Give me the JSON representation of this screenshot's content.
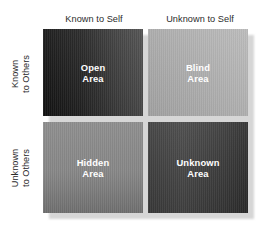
{
  "diagram": {
    "columns": [
      {
        "id": "known-to-self",
        "label": "Known to Self"
      },
      {
        "id": "unknown-to-self",
        "label": "Unknown to Self"
      }
    ],
    "rows": [
      {
        "id": "known-to-others",
        "line1": "Known",
        "line2": "to Others"
      },
      {
        "id": "unknown-to-others",
        "line1": "Unknown",
        "line2": "to Others"
      }
    ],
    "quadrants": [
      {
        "id": "open-area",
        "line1": "Open",
        "line2": "Area",
        "row": "known-to-others",
        "column": "known-to-self",
        "fill_from": "#141414",
        "fill_to": "#4e4e4e",
        "text_color": "#ffffff"
      },
      {
        "id": "blind-area",
        "line1": "Blind",
        "line2": "Area",
        "row": "known-to-others",
        "column": "unknown-to-self",
        "fill_from": "#a9a9a9",
        "fill_to": "#b9b9b9",
        "text_color": "#ffffff"
      },
      {
        "id": "hidden-area",
        "line1": "Hidden",
        "line2": "Area",
        "row": "unknown-to-others",
        "column": "known-to-self",
        "fill_from": "#8f8f8f",
        "fill_to": "#6f6f6f",
        "text_color": "#ffffff"
      },
      {
        "id": "unknown-area",
        "line1": "Unknown",
        "line2": "Area",
        "row": "unknown-to-others",
        "column": "unknown-to-self",
        "fill_from": "#3e3e3e",
        "fill_to": "#2e2e2e",
        "text_color": "#ffffff"
      }
    ],
    "background_color": "#ffffff",
    "shadow_color": "#c9c9c9",
    "header_text_color": "#2b2b2b"
  }
}
